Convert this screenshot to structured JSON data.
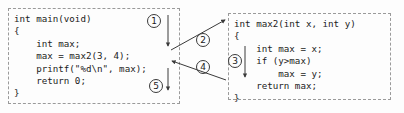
{
  "diagram": {
    "background_color": "#fdfdfd",
    "line_color": "#3a3a3a",
    "box_border_color": "#9a9a9a",
    "text_color": "#1b1b1b"
  },
  "boxes": {
    "main": {
      "name": "main-function-box",
      "code": "int main(void)\n{\n    int max;\n    max = max2(3, 4);\n    printf(\"%d\\n\", max);\n    return 0;\n}"
    },
    "max2": {
      "name": "max2-function-box",
      "code": "int max2(int x, int y)\n{\n    int max = x;\n    if (y>max)\n        max = y;\n    return max;\n}"
    }
  },
  "steps": [
    {
      "id": "1",
      "label": "①",
      "text": "1",
      "description": "execution proceeds in main down to the call"
    },
    {
      "id": "2",
      "label": "②",
      "text": "2",
      "description": "control transfers from main into max2"
    },
    {
      "id": "3",
      "label": "③",
      "text": "3",
      "description": "max2 body executes"
    },
    {
      "id": "4",
      "label": "④",
      "text": "4",
      "description": "max2 returns value back to main"
    },
    {
      "id": "5",
      "label": "⑤",
      "text": "5",
      "description": "main continues after the call"
    }
  ]
}
